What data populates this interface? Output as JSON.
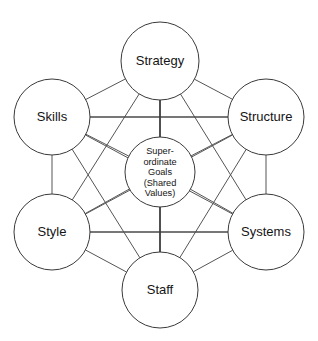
{
  "diagram": {
    "background_color": "#ffffff",
    "line_color": "#555555",
    "stroke_color": "#3a3a3a",
    "text_color": "#141414",
    "center": {
      "name": "superordinate-goals",
      "lines": [
        "Super-",
        "ordinate",
        "Goals",
        "(Shared",
        "Values)"
      ],
      "line1": "Super-",
      "line2": "ordinate",
      "line3": "Goals",
      "line4": "(Shared",
      "line5": "Values)",
      "cx": 160,
      "cy": 172,
      "r": 35
    },
    "nodes": [
      {
        "id": "strategy",
        "label": "Strategy",
        "cx": 160,
        "cy": 61,
        "r": 39
      },
      {
        "id": "structure",
        "label": "Structure",
        "cx": 266,
        "cy": 117,
        "r": 38
      },
      {
        "id": "systems",
        "label": "Systems",
        "cx": 266,
        "cy": 232,
        "r": 38
      },
      {
        "id": "staff",
        "label": "Staff",
        "cx": 160,
        "cy": 290,
        "r": 38
      },
      {
        "id": "style",
        "label": "Style",
        "cx": 52,
        "cy": 232,
        "r": 38
      },
      {
        "id": "skills",
        "label": "Skills",
        "cx": 52,
        "cy": 117,
        "r": 38
      }
    ],
    "connections": [
      {
        "from": "strategy",
        "to": "structure"
      },
      {
        "from": "strategy",
        "to": "systems"
      },
      {
        "from": "strategy",
        "to": "staff"
      },
      {
        "from": "strategy",
        "to": "style"
      },
      {
        "from": "strategy",
        "to": "skills"
      },
      {
        "from": "structure",
        "to": "systems"
      },
      {
        "from": "structure",
        "to": "staff"
      },
      {
        "from": "structure",
        "to": "style"
      },
      {
        "from": "structure",
        "to": "skills"
      },
      {
        "from": "systems",
        "to": "staff"
      },
      {
        "from": "systems",
        "to": "style"
      },
      {
        "from": "systems",
        "to": "skills"
      },
      {
        "from": "staff",
        "to": "style"
      },
      {
        "from": "staff",
        "to": "skills"
      },
      {
        "from": "style",
        "to": "skills"
      },
      {
        "from": "center",
        "to": "strategy"
      },
      {
        "from": "center",
        "to": "structure"
      },
      {
        "from": "center",
        "to": "systems"
      },
      {
        "from": "center",
        "to": "staff"
      },
      {
        "from": "center",
        "to": "style"
      },
      {
        "from": "center",
        "to": "skills"
      }
    ]
  }
}
